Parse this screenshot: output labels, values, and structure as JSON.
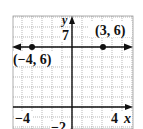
{
  "chart_data": {
    "type": "line",
    "title": "",
    "xlabel": "x",
    "ylabel": "y",
    "xlim": [
      -6,
      6
    ],
    "ylim": [
      -2,
      9
    ],
    "grid": true,
    "x_tick_labels": [
      {
        "value": -4,
        "label": "−4"
      },
      {
        "value": 4,
        "label": "4"
      }
    ],
    "y_tick_labels": [
      {
        "value": 7,
        "label": "7"
      },
      {
        "value": -2,
        "label": "−2"
      }
    ],
    "series": [
      {
        "name": "y = 6",
        "kind": "horizontal-line-with-arrows",
        "y": 6,
        "points": [
          {
            "x": -4,
            "y": 6,
            "label": "(−4, 6)"
          },
          {
            "x": 3,
            "y": 6,
            "label": "(3, 6)"
          }
        ]
      }
    ]
  },
  "labels": {
    "x_axis": "x",
    "y_axis": "y",
    "tick_x_neg4": "−4",
    "tick_x_4": "4",
    "tick_y_7": "7",
    "tick_y_neg2": "−2",
    "point_a": "(−4, 6)",
    "point_b": "(3, 6)"
  },
  "colors": {
    "grid": "#9a9a9a",
    "axis": "#111111",
    "line": "#111111",
    "point": "#111111",
    "background": "#ffffff"
  }
}
